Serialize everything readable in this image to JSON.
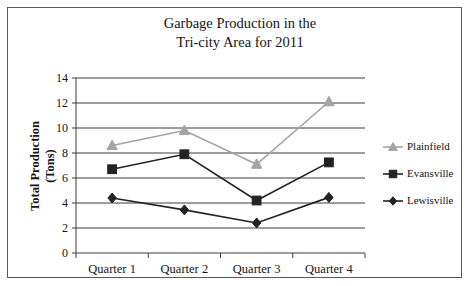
{
  "chart_data": {
    "type": "line",
    "title_lines": [
      "Garbage Production in the",
      "Tri-city Area for 2011"
    ],
    "xlabel": "",
    "ylabel": "Total Production (Tons)",
    "ylabel_lines": [
      "Total Production",
      "(Tons)"
    ],
    "categories": [
      "Quarter 1",
      "Quarter 2",
      "Quarter 3",
      "Quarter 4"
    ],
    "ylim": [
      0,
      14
    ],
    "ytick_step": 2,
    "yticks": [
      "0",
      "2",
      "4",
      "6",
      "8",
      "10",
      "12",
      "14"
    ],
    "grid": true,
    "grid_axis": "y",
    "legend_position": "right",
    "series": [
      {
        "name": "Plainfield",
        "values": [
          8.6,
          9.8,
          7.1,
          12.1
        ],
        "color": "#a3a3a3",
        "marker": "triangle"
      },
      {
        "name": "Evansville",
        "values": [
          6.7,
          7.9,
          4.2,
          7.25
        ],
        "color": "#232323",
        "marker": "square"
      },
      {
        "name": "Lewisville",
        "values": [
          4.4,
          3.45,
          2.4,
          4.45
        ],
        "color": "#232323",
        "marker": "diamond"
      }
    ]
  },
  "figure": {
    "background_color": "#ffffff",
    "border_color": "#5a5a5a",
    "axis_color": "#3c3c3c"
  }
}
